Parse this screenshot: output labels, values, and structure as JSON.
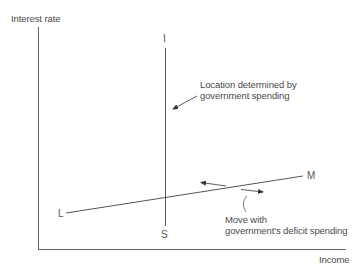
{
  "diagram": {
    "axes": {
      "y_label": "Interest rate",
      "x_label": "Income"
    },
    "curves": {
      "is": {
        "top_label": "I",
        "bottom_label": "S",
        "orientation": "vertical"
      },
      "lm": {
        "left_label": "L",
        "right_label": "M",
        "orientation": "upward-sloping"
      }
    },
    "annotations": {
      "is_note": "Location determined by\ngovernment spending",
      "lm_note": "Move with\ngovernment's deficit spending"
    },
    "colors": {
      "line": "#555555",
      "text": "#4a4a4a",
      "background": "#ffffff"
    }
  }
}
